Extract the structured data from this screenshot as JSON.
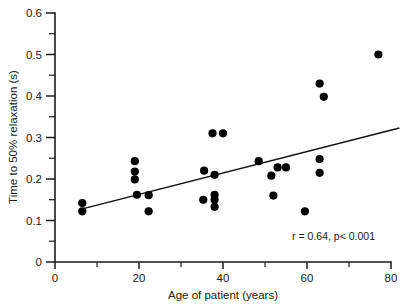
{
  "chart_data": {
    "type": "scatter",
    "title": "",
    "xlabel": "Age of patient (years)",
    "ylabel": "Time to 50% relaxation (s)",
    "xlim": [
      0,
      80
    ],
    "ylim": [
      0,
      0.6
    ],
    "grid": false,
    "legend": null,
    "xticks": [
      0,
      20,
      40,
      60,
      80
    ],
    "xtick_labels": [
      "0",
      "20",
      "40",
      "60",
      "80"
    ],
    "xticks_minor": [
      10,
      30,
      50,
      70
    ],
    "yticks": [
      0,
      0.1,
      0.2,
      0.3,
      0.4,
      0.5,
      0.6
    ],
    "ytick_labels": [
      "0",
      "0.1",
      "0.2",
      "0.3",
      "0.4",
      "0.5",
      "0.6"
    ],
    "yticks_minor": [
      0.05,
      0.15,
      0.25,
      0.35,
      0.45,
      0.55
    ],
    "marker": "filled-circle",
    "marker_color": "#000000",
    "points": [
      {
        "x": 6.5,
        "y": 0.142
      },
      {
        "x": 6.5,
        "y": 0.122
      },
      {
        "x": 19.0,
        "y": 0.243
      },
      {
        "x": 19.0,
        "y": 0.218
      },
      {
        "x": 19.0,
        "y": 0.199
      },
      {
        "x": 19.5,
        "y": 0.162
      },
      {
        "x": 22.3,
        "y": 0.161
      },
      {
        "x": 22.3,
        "y": 0.122
      },
      {
        "x": 35.5,
        "y": 0.22
      },
      {
        "x": 37.5,
        "y": 0.31
      },
      {
        "x": 40.0,
        "y": 0.31
      },
      {
        "x": 38.0,
        "y": 0.21
      },
      {
        "x": 38.0,
        "y": 0.162
      },
      {
        "x": 38.0,
        "y": 0.15
      },
      {
        "x": 38.0,
        "y": 0.133
      },
      {
        "x": 35.3,
        "y": 0.15
      },
      {
        "x": 48.5,
        "y": 0.243
      },
      {
        "x": 51.5,
        "y": 0.208
      },
      {
        "x": 52.0,
        "y": 0.16
      },
      {
        "x": 53.0,
        "y": 0.228
      },
      {
        "x": 55.0,
        "y": 0.228
      },
      {
        "x": 59.5,
        "y": 0.122
      },
      {
        "x": 63.0,
        "y": 0.43
      },
      {
        "x": 64.0,
        "y": 0.398
      },
      {
        "x": 63.0,
        "y": 0.248
      },
      {
        "x": 63.0,
        "y": 0.215
      },
      {
        "x": 77.0,
        "y": 0.5
      }
    ],
    "fit_line": {
      "type": "linear-regression",
      "x_start": 6.5,
      "y_start": 0.128,
      "x_end": 82.0,
      "y_end": 0.323
    },
    "annotation": "r = 0.64, p< 0.001"
  }
}
